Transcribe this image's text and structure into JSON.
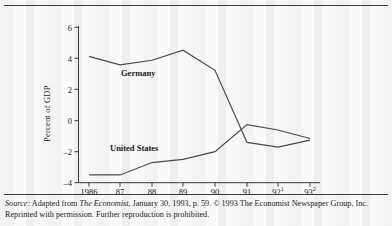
{
  "figure": {
    "background_color": "#fbfbfb",
    "rule_color": "#3b3b3b"
  },
  "chart_data": {
    "type": "line",
    "title": "",
    "subtitle": "",
    "xlabel": "",
    "ylabel": "Percent of GDP",
    "x": [
      "1986",
      "87",
      "88",
      "89",
      "90",
      "91",
      "92",
      "93"
    ],
    "x_tick_labels": [
      "1986",
      "87",
      "88",
      "89",
      "90",
      "91",
      "92",
      "93"
    ],
    "x_tick_superscripts": [
      "",
      "",
      "",
      "",
      "",
      "",
      "1",
      "2"
    ],
    "y_tick_labels": [
      "6",
      "4",
      "2",
      "0",
      "–2",
      "–4"
    ],
    "y_ticks": [
      6,
      4,
      2,
      0,
      -2,
      -4
    ],
    "ylim": [
      -4,
      6
    ],
    "grid": false,
    "legend_position": "inline-labels",
    "line_color": "#4a4a4a",
    "series": [
      {
        "name": "Germany",
        "label": "Germany",
        "label_x": "89",
        "values": [
          4.15,
          3.6,
          3.9,
          4.55,
          3.25,
          -1.4,
          -1.7,
          -1.25
        ]
      },
      {
        "name": "United States",
        "label": "United States",
        "label_x": "88",
        "values": [
          -3.5,
          -3.5,
          -2.7,
          -2.5,
          -2.0,
          -0.25,
          -0.6,
          -1.15
        ]
      }
    ]
  },
  "source": {
    "label": "Source:",
    "text_1": " Adapted from ",
    "publication": "The Economist",
    "text_2": ", January 30, 1993, p. 59. © 1993 The Economist Newspaper Group, Inc. Reprinted with permission. Further reproduction is prohibited."
  }
}
